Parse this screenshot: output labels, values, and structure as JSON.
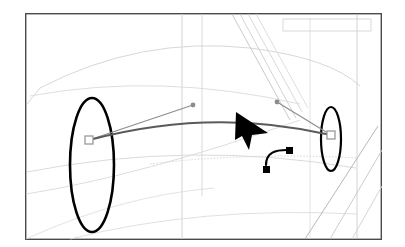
{
  "canvas": {
    "width": 405,
    "height": 247,
    "background_color": "#ffffff",
    "frame": {
      "label": "artboard-frame",
      "x": 25,
      "y": 13,
      "width": 357,
      "height": 227,
      "stroke_color": "#4a4a4a",
      "stroke_width": 1.4,
      "fill": "#ffffff"
    }
  },
  "colors": {
    "path_stroke": "#000000",
    "curve_stroke": "#5a5a5a",
    "handle_line": "#8c8c8c",
    "anchor_border": "#9a9a9a",
    "anchor_fill": "#ffffff",
    "guide_light": "#d8d8d8",
    "guide_mid": "#c0c0c0",
    "cursor_fill": "#000000",
    "tool_glyph": "#000000"
  },
  "background_guides": {
    "description": "faint technical drawing construction lines",
    "vertical_lines": [
      {
        "name": "guide-vertical-1",
        "x": 182,
        "y1": 14,
        "y2": 239,
        "color": "#d4d4d4"
      },
      {
        "name": "guide-vertical-2",
        "x": 202,
        "y1": 14,
        "y2": 196,
        "color": "#cfcfcf"
      },
      {
        "name": "guide-vertical-3",
        "x": 357,
        "y1": 14,
        "y2": 239,
        "color": "#c8c8c8"
      },
      {
        "name": "guide-vertical-4",
        "x": 310,
        "y1": 18,
        "y2": 239,
        "color": "#dcdcdc"
      }
    ],
    "arcs": [
      {
        "name": "guide-arc-upper",
        "d": "M 27 104 L 40 88 Q 140 36 250 48 Q 330 58 360 86",
        "color": "#d2d2d2"
      },
      {
        "name": "guide-arc-mid",
        "d": "M 30 96 Q 160 72 300 104",
        "color": "#dadada"
      },
      {
        "name": "guide-arc-lower",
        "d": "M 27 172 Q 190 140 356 168",
        "color": "#d6d6d6"
      },
      {
        "name": "guide-arc-bottom",
        "d": "M 70 239 Q 200 206 357 214",
        "color": "#dcdcdc"
      },
      {
        "name": "guide-arc-left-low",
        "d": "M 26 194 Q 140 176 300 120",
        "color": "#d9d9d9"
      }
    ],
    "diagonal_bundle_upper": [
      {
        "name": "guide-diagonal-u1",
        "x1": 232,
        "y1": 14,
        "x2": 290,
        "y2": 120,
        "color": "#c4c4c4"
      },
      {
        "name": "guide-diagonal-u2",
        "x1": 240,
        "y1": 14,
        "x2": 296,
        "y2": 118,
        "color": "#cdcdcd"
      },
      {
        "name": "guide-diagonal-u3",
        "x1": 248,
        "y1": 14,
        "x2": 302,
        "y2": 112,
        "color": "#d5d5d5"
      },
      {
        "name": "guide-diagonal-u4",
        "x1": 256,
        "y1": 14,
        "x2": 308,
        "y2": 108,
        "color": "#dadada"
      }
    ],
    "diagonal_bundle_lower": [
      {
        "name": "guide-diagonal-l1",
        "x1": 305,
        "y1": 239,
        "x2": 378,
        "y2": 126,
        "color": "#b8b8b8"
      },
      {
        "name": "guide-diagonal-l2",
        "x1": 330,
        "y1": 239,
        "x2": 382,
        "y2": 150,
        "color": "#cccccc"
      },
      {
        "name": "guide-diagonal-l3",
        "x1": 352,
        "y1": 239,
        "x2": 382,
        "y2": 186,
        "color": "#d6d6d6"
      }
    ],
    "corner_rect": {
      "name": "guide-corner-rect",
      "x": 283,
      "y": 19,
      "width": 88,
      "height": 12,
      "color": "#d0d0d0"
    }
  },
  "shapes": {
    "left_ellipse": {
      "name": "left-leaf-path",
      "center_x": 92,
      "center_y": 165,
      "rx": 22,
      "ry": 67,
      "stroke_width": 2.6,
      "stroke_color": "#000000"
    },
    "right_ellipse": {
      "name": "right-leaf-path",
      "center_x": 331,
      "center_y": 139,
      "rx": 10,
      "ry": 32,
      "stroke_width": 2.2,
      "stroke_color": "#000000"
    }
  },
  "bezier": {
    "name": "active-bezier-curve",
    "d": "M 89 140 Q 212 107 331 135",
    "stroke_color": "#5a5a5a",
    "stroke_width": 2.0,
    "anchors": [
      {
        "name": "anchor-point-left",
        "x": 89,
        "y": 140,
        "size": 8,
        "state": "selected"
      },
      {
        "name": "anchor-point-right",
        "x": 331,
        "y": 135,
        "size": 8,
        "state": "selected"
      }
    ],
    "handles": [
      {
        "name": "control-handle-left",
        "from_x": 89,
        "from_y": 140,
        "to_x": 193,
        "to_y": 105,
        "dot_radius": 2.4
      },
      {
        "name": "control-handle-right",
        "from_x": 331,
        "from_y": 135,
        "to_x": 277,
        "to_y": 102,
        "dot_radius": 2.4
      }
    ]
  },
  "cursor": {
    "name": "arrow-cursor",
    "type": "pointer-arrow",
    "tip_x": 236,
    "tip_y": 112,
    "color": "#000000"
  },
  "tool_glyph": {
    "name": "curve-tool-icon",
    "type": "bezier-node-indicator",
    "square_a": {
      "x": 263,
      "y": 166,
      "size": 7
    },
    "square_b": {
      "x": 286,
      "y": 147,
      "size": 7
    },
    "curve_d": "M 266 165 C 266 152 276 150 287 150",
    "color": "#000000"
  }
}
